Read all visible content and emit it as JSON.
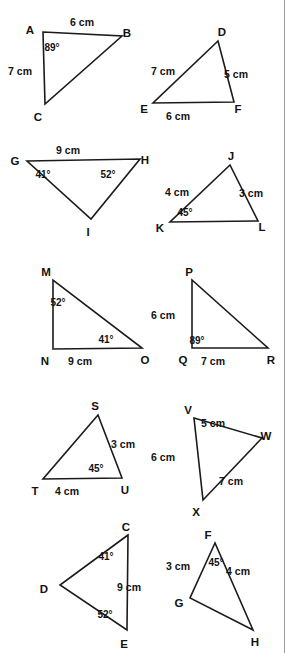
{
  "document": {
    "kind": "geometry-worksheet",
    "title": "Triangle figures worksheet",
    "width": 295,
    "height": 653,
    "background_color": "#ffffff",
    "ink_color": "#1b1b1b",
    "rule_color": "#9a9a9a",
    "unit": "cm",
    "degree_symbol": "°"
  },
  "rule": {
    "name": "right-margin-rule",
    "x": 284.5,
    "y1": 0,
    "y2": 653
  },
  "figures": [
    {
      "id": "abc",
      "name": "triangle-abc",
      "vertices": [
        {
          "label": "A",
          "x": 43,
          "y": 32,
          "lx": 30,
          "ly": 31
        },
        {
          "label": "B",
          "x": 122,
          "y": 36,
          "lx": 127,
          "ly": 34
        },
        {
          "label": "C",
          "x": 45,
          "y": 104,
          "lx": 38,
          "ly": 118
        }
      ],
      "measures": [
        {
          "text": "6 cm",
          "x": 82,
          "y": 23
        },
        {
          "text": "7 cm",
          "x": 20,
          "y": 72
        }
      ],
      "angles": [
        {
          "text": "89°",
          "x": 52,
          "y": 48
        }
      ]
    },
    {
      "id": "def",
      "name": "triangle-def",
      "vertices": [
        {
          "label": "D",
          "x": 218,
          "y": 41,
          "lx": 222,
          "ly": 33
        },
        {
          "label": "E",
          "x": 153,
          "y": 103,
          "lx": 144,
          "ly": 110
        },
        {
          "label": "F",
          "x": 234,
          "y": 102,
          "lx": 238,
          "ly": 110
        }
      ],
      "measures": [
        {
          "text": "7 cm",
          "x": 163,
          "y": 72
        },
        {
          "text": "5 cm",
          "x": 236,
          "y": 75
        },
        {
          "text": "6 cm",
          "x": 178,
          "y": 117
        }
      ],
      "angles": []
    },
    {
      "id": "ghi",
      "name": "triangle-ghi",
      "vertices": [
        {
          "label": "G",
          "x": 27,
          "y": 161,
          "lx": 15,
          "ly": 162
        },
        {
          "label": "H",
          "x": 140,
          "y": 159,
          "lx": 145,
          "ly": 161
        },
        {
          "label": "I",
          "x": 91,
          "y": 219,
          "lx": 88,
          "ly": 233
        }
      ],
      "measures": [
        {
          "text": "9 cm",
          "x": 68,
          "y": 151
        }
      ],
      "angles": [
        {
          "text": "41°",
          "x": 43,
          "y": 175
        },
        {
          "text": "52°",
          "x": 108,
          "y": 175
        }
      ]
    },
    {
      "id": "jkl",
      "name": "triangle-jkl",
      "vertices": [
        {
          "label": "J",
          "x": 230,
          "y": 165,
          "lx": 231,
          "ly": 157
        },
        {
          "label": "K",
          "x": 170,
          "y": 222,
          "lx": 160,
          "ly": 229
        },
        {
          "label": "L",
          "x": 258,
          "y": 221,
          "lx": 262,
          "ly": 228
        }
      ],
      "measures": [
        {
          "text": "4 cm",
          "x": 177,
          "y": 193
        },
        {
          "text": "3 cm",
          "x": 251,
          "y": 194
        }
      ],
      "angles": [
        {
          "text": "45°",
          "x": 185,
          "y": 213
        }
      ]
    },
    {
      "id": "mno",
      "name": "triangle-mno",
      "vertices": [
        {
          "label": "M",
          "x": 53,
          "y": 280,
          "lx": 46,
          "ly": 273
        },
        {
          "label": "N",
          "x": 53,
          "y": 349,
          "lx": 45,
          "ly": 362
        },
        {
          "label": "O",
          "x": 142,
          "y": 348,
          "lx": 145,
          "ly": 361
        }
      ],
      "measures": [
        {
          "text": "9 cm",
          "x": 80,
          "y": 362
        }
      ],
      "angles": [
        {
          "text": "52°",
          "x": 58,
          "y": 303
        },
        {
          "text": "41°",
          "x": 106,
          "y": 340
        }
      ]
    },
    {
      "id": "pqr",
      "name": "triangle-pqr",
      "vertices": [
        {
          "label": "P",
          "x": 192,
          "y": 280,
          "lx": 189,
          "ly": 273
        },
        {
          "label": "Q",
          "x": 192,
          "y": 348,
          "lx": 183,
          "ly": 361
        },
        {
          "label": "R",
          "x": 268,
          "y": 348,
          "lx": 271,
          "ly": 361
        }
      ],
      "measures": [
        {
          "text": "6 cm",
          "x": 163,
          "y": 316
        },
        {
          "text": "7 cm",
          "x": 213,
          "y": 362
        }
      ],
      "angles": [
        {
          "text": "89°",
          "x": 197,
          "y": 341
        }
      ]
    },
    {
      "id": "stu",
      "name": "triangle-stu",
      "vertices": [
        {
          "label": "S",
          "x": 98,
          "y": 415,
          "lx": 95,
          "ly": 407
        },
        {
          "label": "T",
          "x": 43,
          "y": 479,
          "lx": 35,
          "ly": 492
        },
        {
          "label": "U",
          "x": 122,
          "y": 478,
          "lx": 125,
          "ly": 491
        }
      ],
      "measures": [
        {
          "text": "3 cm",
          "x": 123,
          "y": 445
        },
        {
          "text": "4 cm",
          "x": 67,
          "y": 492
        }
      ],
      "angles": [
        {
          "text": "45°",
          "x": 96,
          "y": 469
        }
      ]
    },
    {
      "id": "vwx",
      "name": "triangle-vwx",
      "vertices": [
        {
          "label": "V",
          "x": 194,
          "y": 418,
          "lx": 188,
          "ly": 411
        },
        {
          "label": "W",
          "x": 262,
          "y": 438,
          "lx": 266,
          "ly": 437
        },
        {
          "label": "X",
          "x": 203,
          "y": 500,
          "lx": 196,
          "ly": 513
        }
      ],
      "measures": [
        {
          "text": "5 cm",
          "x": 213,
          "y": 424
        },
        {
          "text": "6 cm",
          "x": 163,
          "y": 458
        },
        {
          "text": "7 cm",
          "x": 231,
          "y": 482
        }
      ],
      "angles": []
    },
    {
      "id": "cde",
      "name": "triangle-cde",
      "vertices": [
        {
          "label": "C",
          "x": 128,
          "y": 535,
          "lx": 126,
          "ly": 528
        },
        {
          "label": "D",
          "x": 60,
          "y": 585,
          "lx": 44,
          "ly": 590
        },
        {
          "label": "E",
          "x": 127,
          "y": 630,
          "lx": 124,
          "ly": 645
        }
      ],
      "measures": [
        {
          "text": "9 cm",
          "x": 129,
          "y": 588
        }
      ],
      "angles": [
        {
          "text": "41°",
          "x": 106,
          "y": 557
        },
        {
          "text": "52°",
          "x": 105,
          "y": 615
        }
      ]
    },
    {
      "id": "fgh",
      "name": "triangle-fgh",
      "vertices": [
        {
          "label": "F",
          "x": 215,
          "y": 543,
          "lx": 208,
          "ly": 536
        },
        {
          "label": "G",
          "x": 190,
          "y": 598,
          "lx": 179,
          "ly": 604
        },
        {
          "label": "H",
          "x": 253,
          "y": 630,
          "lx": 255,
          "ly": 643
        }
      ],
      "measures": [
        {
          "text": "3 cm",
          "x": 178,
          "y": 567
        },
        {
          "text": "4 cm",
          "x": 238,
          "y": 572
        }
      ],
      "angles": [
        {
          "text": "45°",
          "x": 216,
          "y": 563
        }
      ]
    }
  ]
}
